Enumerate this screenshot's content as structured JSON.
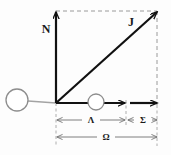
{
  "figure": {
    "type": "vector-force-diagram",
    "background": "#fdfdfd",
    "width": 171,
    "height": 155
  },
  "colors": {
    "stroke_dark": "#111111",
    "stroke_gray": "#8d8d8d",
    "stroke_dashed": "#9a9a9a",
    "circle_stroke": "#8d8d8d",
    "circle_fill": "#ffffff",
    "dimension_line": "#6f6f6f",
    "label": "#1a1a1a"
  },
  "labels": {
    "vertical_vector": "N",
    "diagonal_vector": "J",
    "dimension_inner": "Λ",
    "dimension_outer": "Σ",
    "dimension_total": "Ω"
  },
  "vectors": [
    {
      "name": "N",
      "label": "N",
      "from": [
        56,
        103
      ],
      "to": [
        56,
        12
      ],
      "direction": "up",
      "style": "solid-bold"
    },
    {
      "name": "J",
      "label": "J",
      "from": [
        56,
        103
      ],
      "to": [
        157,
        12
      ],
      "direction": "up-right",
      "style": "solid-bold"
    },
    {
      "name": "horizontal-inner",
      "label": "",
      "from": [
        56,
        103
      ],
      "to": [
        125,
        103
      ],
      "direction": "right",
      "style": "solid-bold"
    },
    {
      "name": "horizontal-outer",
      "label": "",
      "from": [
        130,
        103
      ],
      "to": [
        157,
        103
      ],
      "direction": "right",
      "style": "solid-bold"
    }
  ],
  "circles": [
    {
      "name": "left-node",
      "cx": 17,
      "cy": 100,
      "r": 11
    },
    {
      "name": "middle-node",
      "cx": 96,
      "cy": 102,
      "r": 8
    }
  ],
  "connector": {
    "name": "left-tether",
    "from": [
      28,
      101
    ],
    "to": [
      56,
      103
    ]
  },
  "frame": {
    "top_dashed": {
      "from": [
        56,
        11
      ],
      "to": [
        157,
        11
      ]
    },
    "right_dashed": {
      "from": [
        157,
        11
      ],
      "to": [
        157,
        105
      ]
    }
  },
  "extension_lines": [
    {
      "name": "origin-extension",
      "x": 56,
      "from_y": 103,
      "to_y": 146
    },
    {
      "name": "mid-extension",
      "x": 126,
      "from_y": 100,
      "to_y": 126
    },
    {
      "name": "end-extension",
      "x": 157,
      "from_y": 105,
      "to_y": 146
    }
  ],
  "dimensions": [
    {
      "name": "dimension-lambda",
      "label": "Λ",
      "y": 120,
      "x1": 57,
      "x2": 125,
      "label_x": 91
    },
    {
      "name": "dimension-sigma",
      "label": "Σ",
      "y": 120,
      "x1": 128,
      "x2": 157,
      "label_x": 143
    },
    {
      "name": "dimension-omega",
      "label": "Ω",
      "y": 137,
      "x1": 57,
      "x2": 157,
      "label_x": 106
    }
  ],
  "label_positions": {
    "N": {
      "x": 46,
      "y": 33
    },
    "J": {
      "x": 131,
      "y": 26
    }
  }
}
